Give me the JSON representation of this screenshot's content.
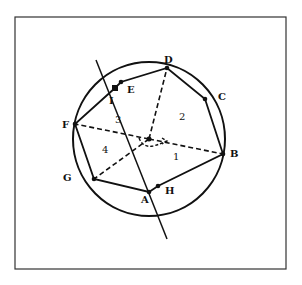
{
  "diagram": {
    "type": "geometry",
    "colors": {
      "stroke": "#111111",
      "background": "#ffffff",
      "frame": "#333333"
    },
    "frame": {
      "x": 15,
      "y": 17,
      "width": 271,
      "height": 252
    },
    "circle": {
      "cx": 149,
      "cy": 139,
      "rx": 76,
      "ry": 77
    },
    "center": {
      "x": 149,
      "y": 139
    },
    "points": [
      {
        "id": "A",
        "label": "A",
        "x": 149,
        "y": 192,
        "lx": 141,
        "ly": 203
      },
      {
        "id": "B",
        "label": "B",
        "x": 223,
        "y": 154,
        "lx": 230,
        "ly": 157
      },
      {
        "id": "C",
        "label": "C",
        "x": 205,
        "y": 99,
        "lx": 218,
        "ly": 100
      },
      {
        "id": "D",
        "label": "D",
        "x": 167,
        "y": 68,
        "lx": 164,
        "ly": 63
      },
      {
        "id": "E",
        "label": "E",
        "x": 121,
        "y": 82,
        "lx": 127,
        "ly": 93
      },
      {
        "id": "F",
        "label": "F",
        "x": 75,
        "y": 124,
        "lx": 62,
        "ly": 128
      },
      {
        "id": "G",
        "label": "G",
        "x": 94,
        "y": 179,
        "lx": 63,
        "ly": 181
      },
      {
        "id": "H",
        "label": "H",
        "x": 158,
        "y": 186,
        "lx": 165,
        "ly": 194
      },
      {
        "id": "I",
        "label": "I",
        "x": 115,
        "y": 88,
        "lx": 109,
        "ly": 104
      }
    ],
    "polygon_order": [
      "A",
      "H",
      "B",
      "C",
      "D",
      "E",
      "I",
      "F",
      "G"
    ],
    "dashed_spokes": [
      "B",
      "D",
      "F",
      "G"
    ],
    "through_line": {
      "x1": 96,
      "y1": 60,
      "x2": 167,
      "y2": 239
    },
    "regions": [
      {
        "label": "1",
        "x": 173,
        "y": 160
      },
      {
        "label": "2",
        "x": 179,
        "y": 120
      },
      {
        "label": "3",
        "x": 115,
        "y": 123
      },
      {
        "label": "4",
        "x": 102,
        "y": 153
      }
    ],
    "angle_arc": {
      "description": "dashed arc with arrow below center from F-side to B-side"
    }
  }
}
